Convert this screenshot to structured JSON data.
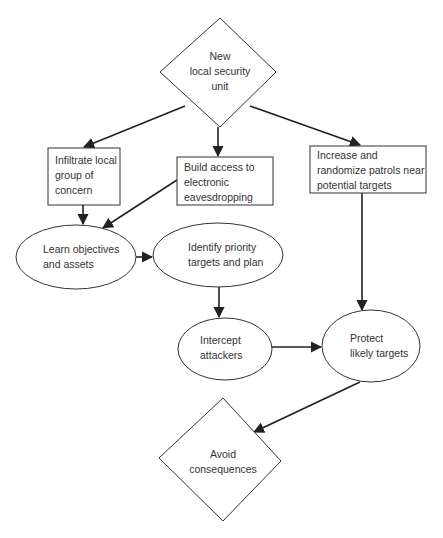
{
  "diagram": {
    "type": "flowchart",
    "colors": {
      "stroke": "#333333",
      "text": "#333333",
      "background": "#ffffff"
    },
    "nodes": [
      {
        "id": "new_unit",
        "shape": "diamond",
        "lines": [
          "New",
          "local security",
          "unit"
        ]
      },
      {
        "id": "infiltrate",
        "shape": "rectangle",
        "lines": [
          "Infiltrate local",
          "group of",
          "concern"
        ]
      },
      {
        "id": "build_access",
        "shape": "rectangle",
        "lines": [
          "Build access to",
          "electronic",
          "eavesdropping"
        ]
      },
      {
        "id": "increase_patrols",
        "shape": "rectangle",
        "lines": [
          "Increase and",
          "randomize patrols near",
          "potential targets"
        ]
      },
      {
        "id": "learn",
        "shape": "ellipse",
        "lines": [
          "Learn objectives",
          "and assets"
        ]
      },
      {
        "id": "identify",
        "shape": "ellipse",
        "lines": [
          "Identify priority",
          "targets and plan"
        ]
      },
      {
        "id": "intercept",
        "shape": "ellipse",
        "lines": [
          "Intercept",
          "attackers"
        ]
      },
      {
        "id": "protect",
        "shape": "ellipse",
        "lines": [
          "Protect",
          "likely targets"
        ]
      },
      {
        "id": "avoid",
        "shape": "diamond",
        "lines": [
          "Avoid",
          "consequences"
        ]
      }
    ],
    "edges": [
      {
        "from": "new_unit",
        "to": "infiltrate"
      },
      {
        "from": "new_unit",
        "to": "build_access"
      },
      {
        "from": "new_unit",
        "to": "increase_patrols"
      },
      {
        "from": "infiltrate",
        "to": "learn"
      },
      {
        "from": "build_access",
        "to": "learn"
      },
      {
        "from": "learn",
        "to": "identify"
      },
      {
        "from": "identify",
        "to": "intercept"
      },
      {
        "from": "intercept",
        "to": "protect"
      },
      {
        "from": "increase_patrols",
        "to": "protect"
      },
      {
        "from": "protect",
        "to": "avoid"
      }
    ]
  }
}
